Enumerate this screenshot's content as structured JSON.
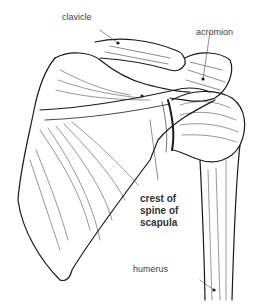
{
  "figure": {
    "labels": {
      "clavicle": "clavicle",
      "acromion": "acromion",
      "crest_line1": "crest of",
      "crest_line2": "spine of",
      "crest_line3": "scapula",
      "humerus": "humerus"
    },
    "colors": {
      "line": "#1a1a1a",
      "label": "#444444",
      "background": "#ffffff"
    }
  }
}
